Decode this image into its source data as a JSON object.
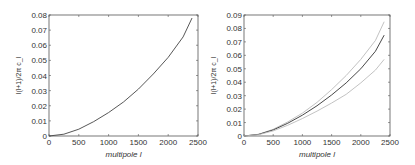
{
  "chart_data": [
    {
      "type": "line",
      "title": "",
      "xlabel": "multipole l",
      "ylabel": "l(l+1)/2π c_l",
      "xlim": [
        0,
        2500
      ],
      "ylim": [
        0,
        0.08
      ],
      "xticks": [
        0,
        500,
        1000,
        1500,
        2000,
        2500
      ],
      "yticks": [
        0,
        0.01,
        0.02,
        0.03,
        0.04,
        0.05,
        0.06,
        0.07,
        0.08
      ],
      "grid": false,
      "series": [
        {
          "name": "spectrum",
          "color": "#444444",
          "x": [
            0,
            250,
            500,
            750,
            1000,
            1250,
            1500,
            1750,
            2000,
            2250,
            2400
          ],
          "y": [
            0,
            0.0012,
            0.0045,
            0.0095,
            0.0155,
            0.0225,
            0.031,
            0.041,
            0.052,
            0.0655,
            0.078
          ]
        }
      ]
    },
    {
      "type": "line",
      "title": "",
      "xlabel": "multipole l",
      "ylabel": "l(l+1)/2π c_l",
      "xlim": [
        0,
        2500
      ],
      "ylim": [
        0,
        0.09
      ],
      "xticks": [
        0,
        500,
        1000,
        1500,
        2000,
        2500
      ],
      "yticks": [
        0,
        0.01,
        0.02,
        0.03,
        0.04,
        0.05,
        0.06,
        0.07,
        0.08,
        0.09
      ],
      "grid": false,
      "series": [
        {
          "name": "upper bound",
          "color": "#bbbbbb",
          "x": [
            0,
            250,
            500,
            750,
            1000,
            1250,
            1500,
            1750,
            2000,
            2250,
            2400
          ],
          "y": [
            0,
            0.0013,
            0.005,
            0.0105,
            0.017,
            0.025,
            0.0345,
            0.045,
            0.057,
            0.071,
            0.085
          ]
        },
        {
          "name": "mean",
          "color": "#333333",
          "x": [
            0,
            250,
            500,
            750,
            1000,
            1250,
            1500,
            1750,
            2000,
            2250,
            2400
          ],
          "y": [
            0,
            0.0012,
            0.0045,
            0.0095,
            0.0155,
            0.0225,
            0.0305,
            0.0395,
            0.05,
            0.063,
            0.075
          ]
        },
        {
          "name": "lower bound",
          "color": "#bbbbbb",
          "x": [
            0,
            250,
            500,
            750,
            1000,
            1250,
            1500,
            1750,
            2000,
            2250,
            2400
          ],
          "y": [
            0,
            0.001,
            0.0038,
            0.008,
            0.013,
            0.0185,
            0.0245,
            0.031,
            0.0395,
            0.049,
            0.057
          ]
        }
      ]
    }
  ]
}
